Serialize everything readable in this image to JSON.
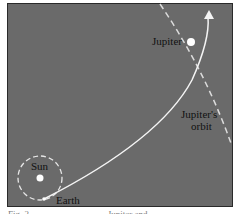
{
  "diagram": {
    "labels": {
      "jupiter": "Jupiter",
      "jupiters_orbit_line1": "Jupiter's",
      "jupiters_orbit_line2": "orbit",
      "sun": "Sun",
      "earth": "Earth"
    },
    "caption": "Fig. 2                                   Jupiter and",
    "colors": {
      "background": "#6a6a6a",
      "lines": "#f2f2f2",
      "text": "#111111"
    }
  }
}
